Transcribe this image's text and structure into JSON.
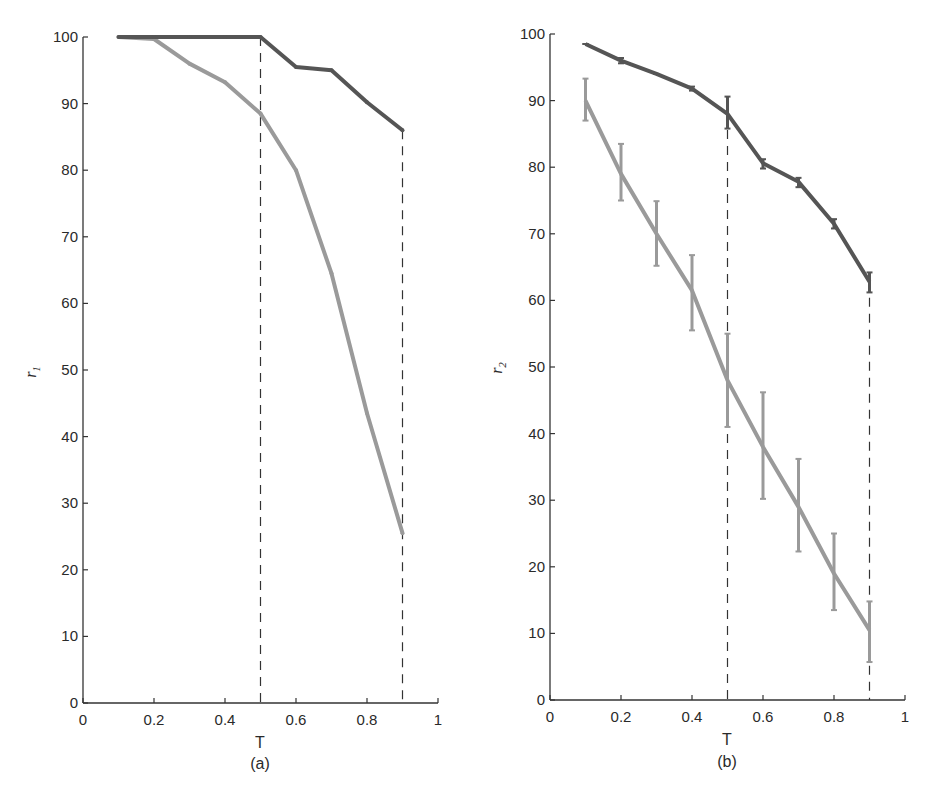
{
  "chart_data": [
    {
      "type": "line",
      "panel": "(a)",
      "title": "",
      "xlabel": "T",
      "ylabel": "r1",
      "ylabel_main": "r",
      "ylabel_sub": "1",
      "xlim": [
        0,
        1
      ],
      "ylim": [
        0,
        100
      ],
      "grid": false,
      "x_ticks": [
        0,
        0.2,
        0.4,
        0.6,
        0.8,
        1
      ],
      "x_tick_labels": [
        "0",
        "0.2",
        "0.4",
        "0.6",
        "0.8",
        "1"
      ],
      "y_ticks": [
        0,
        10,
        20,
        30,
        40,
        50,
        60,
        70,
        80,
        90,
        100
      ],
      "y_tick_labels": [
        "0",
        "10",
        "20",
        "30",
        "40",
        "50",
        "60",
        "70",
        "80",
        "90",
        "100"
      ],
      "vlines": [
        0.5,
        0.9
      ],
      "series": [
        {
          "name": "dark",
          "color": "#555555",
          "x": [
            0.1,
            0.2,
            0.3,
            0.4,
            0.5,
            0.6,
            0.7,
            0.8,
            0.9
          ],
          "values": [
            100,
            100,
            100,
            100,
            100,
            95.5,
            95,
            90.2,
            86
          ]
        },
        {
          "name": "light",
          "color": "#9a9a9a",
          "x": [
            0.1,
            0.2,
            0.3,
            0.4,
            0.5,
            0.6,
            0.7,
            0.8,
            0.9
          ],
          "values": [
            100,
            99.7,
            96,
            93.2,
            88.5,
            80,
            64.5,
            43.5,
            25.5
          ]
        }
      ]
    },
    {
      "type": "line",
      "panel": "(b)",
      "title": "",
      "xlabel": "T",
      "ylabel": "r2",
      "ylabel_main": "r",
      "ylabel_sub": "2",
      "xlim": [
        0,
        1
      ],
      "ylim": [
        0,
        100
      ],
      "grid": false,
      "x_ticks": [
        0,
        0.2,
        0.4,
        0.6,
        0.8,
        1
      ],
      "x_tick_labels": [
        "0",
        "0.2",
        "0.4",
        "0.6",
        "0.8",
        "1"
      ],
      "y_ticks": [
        0,
        10,
        20,
        30,
        40,
        50,
        60,
        70,
        80,
        90,
        100
      ],
      "y_tick_labels": [
        "0",
        "10",
        "20",
        "30",
        "40",
        "50",
        "60",
        "70",
        "80",
        "90",
        "100"
      ],
      "vlines": [
        0.5,
        0.9
      ],
      "series": [
        {
          "name": "dark",
          "color": "#555555",
          "x": [
            0.1,
            0.2,
            0.3,
            0.4,
            0.5,
            0.6,
            0.7,
            0.8,
            0.9
          ],
          "values": [
            98.5,
            96,
            94,
            91.8,
            88,
            80.6,
            77.8,
            71.5,
            62.8
          ],
          "err_low": [
            98.5,
            95.6,
            94,
            91.5,
            85.8,
            79.8,
            77,
            70.8,
            61.2
          ],
          "err_high": [
            98.5,
            96.4,
            94,
            92.1,
            90.6,
            81.2,
            78.4,
            72.2,
            64.2
          ]
        },
        {
          "name": "light",
          "color": "#9a9a9a",
          "x": [
            0.1,
            0.2,
            0.3,
            0.4,
            0.5,
            0.6,
            0.7,
            0.8,
            0.9
          ],
          "values": [
            90,
            79,
            70,
            61.5,
            48,
            38,
            29,
            19,
            10.5
          ],
          "err_low": [
            87,
            75,
            65.2,
            55.5,
            41,
            30.2,
            22.3,
            13.5,
            5.7
          ],
          "err_high": [
            93.3,
            83.5,
            74.9,
            66.8,
            55,
            46.2,
            36.2,
            25,
            14.8
          ]
        }
      ]
    }
  ],
  "panels": [
    {
      "caption": "(a)",
      "xlabel": "T",
      "ylabel_main": "r",
      "ylabel_sub": "1"
    },
    {
      "caption": "(b)",
      "xlabel": "T",
      "ylabel_main": "r",
      "ylabel_sub": "2"
    }
  ]
}
